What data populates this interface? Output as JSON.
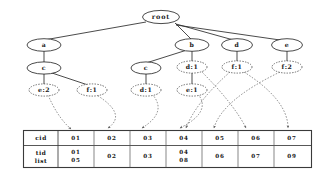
{
  "diagram": {
    "root_label": "root",
    "colors": {
      "solid_stroke": "#2b2b2b",
      "dashed_stroke": "#4a4a4a",
      "link_stroke": "#5a5a5a",
      "table_stroke": "#3a3a3a",
      "background": "#ffffff",
      "text": "#141414"
    },
    "nodes": {
      "root": {
        "label": "root",
        "style": "solid"
      },
      "a": {
        "label": "a",
        "style": "solid"
      },
      "b": {
        "label": "b",
        "style": "solid"
      },
      "d": {
        "label": "d",
        "style": "solid"
      },
      "e": {
        "label": "e",
        "style": "solid"
      },
      "c_left": {
        "label": "c",
        "style": "solid"
      },
      "c_mid": {
        "label": "c",
        "style": "solid"
      },
      "d1_top": {
        "label": "d:1",
        "style": "dashed"
      },
      "f1_top": {
        "label": "f:1",
        "style": "dashed"
      },
      "f2_top": {
        "label": "f:2",
        "style": "dashed"
      },
      "e2": {
        "label": "e:2",
        "style": "dashed"
      },
      "f1_bot": {
        "label": "f:1",
        "style": "dashed"
      },
      "d1_bot": {
        "label": "d:1",
        "style": "dashed"
      },
      "e1": {
        "label": "e:1",
        "style": "dashed"
      }
    },
    "edges": [
      {
        "from": "root",
        "to": "a"
      },
      {
        "from": "root",
        "to": "b"
      },
      {
        "from": "root",
        "to": "d"
      },
      {
        "from": "root",
        "to": "e"
      },
      {
        "from": "a",
        "to": "c_left"
      },
      {
        "from": "b",
        "to": "c_mid"
      },
      {
        "from": "b",
        "to": "d1_top"
      },
      {
        "from": "d",
        "to": "f1_top"
      },
      {
        "from": "e",
        "to": "f2_top"
      },
      {
        "from": "c_left",
        "to": "e2"
      },
      {
        "from": "c_left",
        "to": "f1_bot"
      },
      {
        "from": "c_mid",
        "to": "d1_bot"
      },
      {
        "from": "d1_top",
        "to": "e1"
      }
    ],
    "node_links": [
      {
        "from": "e2",
        "to_column": "01"
      },
      {
        "from": "f1_bot",
        "to_column": "02"
      },
      {
        "from": "d1_bot",
        "to_column": "03"
      },
      {
        "from": "e1",
        "to_column": "04"
      },
      {
        "from": "f1_top",
        "to_column": "04"
      },
      {
        "from": "f2_top",
        "to_column": "05"
      },
      {
        "from": "d1_top",
        "to_column": "06"
      },
      {
        "from": "f1_top",
        "to_column": "07"
      }
    ]
  },
  "table": {
    "row_labels": {
      "cid": "cid",
      "tid_list_line1": "tid",
      "tid_list_line2": "list"
    },
    "columns": [
      {
        "cid": "01",
        "tid_list": [
          "01",
          "05"
        ]
      },
      {
        "cid": "02",
        "tid_list": [
          "02"
        ]
      },
      {
        "cid": "03",
        "tid_list": [
          "03"
        ]
      },
      {
        "cid": "04",
        "tid_list": [
          "04",
          "08"
        ]
      },
      {
        "cid": "05",
        "tid_list": [
          "06"
        ]
      },
      {
        "cid": "06",
        "tid_list": [
          "07"
        ]
      },
      {
        "cid": "07",
        "tid_list": [
          "09"
        ]
      }
    ]
  }
}
